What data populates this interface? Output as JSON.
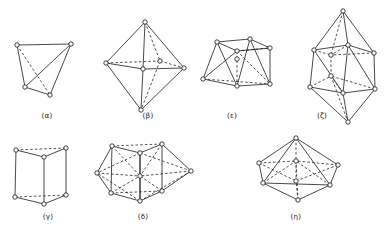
{
  "figure": {
    "background_color": "#ffffff",
    "line_color": "#1a1a1a",
    "vertex_fill": "#ffffff",
    "vertex_stroke": "#111111",
    "vertex_radius": 2.2,
    "rows": 2,
    "columns": 4
  },
  "panels": [
    {
      "id": "alpha",
      "label": "(α)",
      "label_x": 47,
      "label_y": 118,
      "shape_name": "tetrahedron",
      "vertex_count": 4,
      "row": 1,
      "column": 1,
      "vertices": [
        [
          17,
          45
        ],
        [
          71,
          44
        ],
        [
          25,
          87
        ],
        [
          50,
          95
        ]
      ],
      "solid_edges": [
        [
          0,
          1
        ],
        [
          0,
          2
        ],
        [
          1,
          2
        ],
        [
          1,
          3
        ],
        [
          2,
          3
        ]
      ],
      "dashed_edges": [
        [
          0,
          3
        ]
      ]
    },
    {
      "id": "beta",
      "label": "(β)",
      "label_x": 148,
      "label_y": 118,
      "shape_name": "octahedron",
      "vertex_count": 6,
      "row": 1,
      "column": 2,
      "vertices": [
        [
          145,
          22
        ],
        [
          106,
          63
        ],
        [
          143,
          69
        ],
        [
          160,
          61
        ],
        [
          184,
          68
        ],
        [
          141,
          110
        ]
      ],
      "solid_edges": [
        [
          0,
          1
        ],
        [
          0,
          2
        ],
        [
          0,
          4
        ],
        [
          1,
          2
        ],
        [
          2,
          4
        ],
        [
          1,
          5
        ],
        [
          2,
          5
        ],
        [
          4,
          5
        ]
      ],
      "dashed_edges": [
        [
          0,
          3
        ],
        [
          1,
          3
        ],
        [
          3,
          4
        ],
        [
          3,
          5
        ]
      ]
    },
    {
      "id": "epsilon",
      "label": "(ε)",
      "label_x": 232,
      "label_y": 118,
      "shape_name": "square-antiprism",
      "vertex_count": 8,
      "row": 1,
      "column": 3,
      "vertices": [
        [
          217,
          42
        ],
        [
          250,
          39
        ],
        [
          270,
          48
        ],
        [
          237,
          51
        ],
        [
          203,
          79
        ],
        [
          237,
          86
        ],
        [
          270,
          84
        ],
        [
          237,
          59
        ]
      ],
      "solid_edges": [
        [
          0,
          1
        ],
        [
          1,
          2
        ],
        [
          0,
          4
        ],
        [
          2,
          6
        ],
        [
          4,
          5
        ],
        [
          5,
          6
        ],
        [
          0,
          5
        ],
        [
          1,
          5
        ],
        [
          1,
          6
        ],
        [
          2,
          3
        ],
        [
          0,
          3
        ],
        [
          3,
          4
        ]
      ],
      "dashed_edges": [
        [
          3,
          2
        ],
        [
          3,
          6
        ],
        [
          4,
          6
        ],
        [
          3,
          5
        ]
      ]
    },
    {
      "id": "zeta",
      "label": "(ζ)",
      "label_x": 322,
      "label_y": 118,
      "shape_name": "bicapped-square-antiprism",
      "vertex_count": 10,
      "row": 1,
      "column": 4,
      "vertices": [
        [
          343,
          11
        ],
        [
          314,
          50
        ],
        [
          348,
          45
        ],
        [
          374,
          53
        ],
        [
          331,
          55
        ],
        [
          310,
          87
        ],
        [
          343,
          93
        ],
        [
          375,
          89
        ],
        [
          331,
          76
        ],
        [
          348,
          122
        ]
      ],
      "solid_edges": [
        [
          0,
          1
        ],
        [
          0,
          2
        ],
        [
          0,
          3
        ],
        [
          1,
          2
        ],
        [
          2,
          3
        ],
        [
          1,
          5
        ],
        [
          3,
          7
        ],
        [
          5,
          6
        ],
        [
          6,
          7
        ],
        [
          1,
          6
        ],
        [
          2,
          6
        ],
        [
          2,
          7
        ],
        [
          5,
          9
        ],
        [
          6,
          9
        ],
        [
          7,
          9
        ]
      ],
      "dashed_edges": [
        [
          0,
          4
        ],
        [
          1,
          4
        ],
        [
          2,
          4
        ],
        [
          3,
          4
        ],
        [
          4,
          8
        ],
        [
          5,
          8
        ],
        [
          6,
          8
        ],
        [
          7,
          8
        ],
        [
          8,
          9
        ]
      ]
    },
    {
      "id": "gamma",
      "label": "(γ)",
      "label_x": 48,
      "label_y": 219,
      "shape_name": "trigonal-prism",
      "vertex_count": 6,
      "row": 2,
      "column": 1,
      "vertices": [
        [
          16,
          150
        ],
        [
          66,
          148
        ],
        [
          44,
          157
        ],
        [
          15,
          197
        ],
        [
          66,
          195
        ],
        [
          44,
          204
        ]
      ],
      "solid_edges": [
        [
          0,
          2
        ],
        [
          1,
          2
        ],
        [
          0,
          3
        ],
        [
          1,
          4
        ],
        [
          2,
          5
        ],
        [
          3,
          5
        ],
        [
          4,
          5
        ]
      ],
      "dashed_edges": [
        [
          0,
          1
        ],
        [
          3,
          4
        ]
      ]
    },
    {
      "id": "delta",
      "label": "(δ)",
      "label_x": 143,
      "label_y": 219,
      "shape_name": "tricapped-trigonal-prism",
      "vertex_count": 9,
      "row": 2,
      "column": 2,
      "vertices": [
        [
          112,
          146
        ],
        [
          162,
          144
        ],
        [
          140,
          153
        ],
        [
          111,
          193
        ],
        [
          162,
          191
        ],
        [
          140,
          201
        ],
        [
          97,
          173
        ],
        [
          191,
          171
        ],
        [
          140,
          176
        ]
      ],
      "solid_edges": [
        [
          0,
          2
        ],
        [
          1,
          2
        ],
        [
          0,
          3
        ],
        [
          1,
          4
        ],
        [
          2,
          5
        ],
        [
          3,
          5
        ],
        [
          4,
          5
        ],
        [
          0,
          6
        ],
        [
          3,
          6
        ],
        [
          1,
          7
        ],
        [
          4,
          7
        ],
        [
          2,
          8
        ],
        [
          5,
          8
        ]
      ],
      "dashed_edges": [
        [
          0,
          1
        ],
        [
          3,
          4
        ],
        [
          2,
          6
        ],
        [
          5,
          6
        ],
        [
          2,
          7
        ],
        [
          5,
          7
        ],
        [
          0,
          8
        ],
        [
          1,
          8
        ],
        [
          3,
          8
        ],
        [
          4,
          8
        ],
        [
          6,
          8
        ],
        [
          7,
          8
        ]
      ]
    },
    {
      "id": "eta",
      "label": "(η)",
      "label_x": 296,
      "label_y": 219,
      "shape_name": "bicapped-pentagonal-bipyramid",
      "vertex_count": 8,
      "row": 2,
      "column": 3,
      "vertices": [
        [
          296,
          138
        ],
        [
          259,
          163
        ],
        [
          338,
          165
        ],
        [
          263,
          183
        ],
        [
          330,
          185
        ],
        [
          298,
          200
        ],
        [
          296,
          161
        ],
        [
          296,
          181
        ]
      ],
      "solid_edges": [
        [
          0,
          1
        ],
        [
          0,
          2
        ],
        [
          1,
          3
        ],
        [
          2,
          4
        ],
        [
          3,
          5
        ],
        [
          4,
          5
        ],
        [
          0,
          3
        ],
        [
          0,
          4
        ],
        [
          3,
          4
        ]
      ],
      "dashed_edges": [
        [
          0,
          6
        ],
        [
          1,
          6
        ],
        [
          2,
          6
        ],
        [
          3,
          6
        ],
        [
          4,
          6
        ],
        [
          6,
          7
        ],
        [
          1,
          7
        ],
        [
          2,
          7
        ],
        [
          5,
          7
        ],
        [
          5,
          6
        ]
      ]
    }
  ]
}
